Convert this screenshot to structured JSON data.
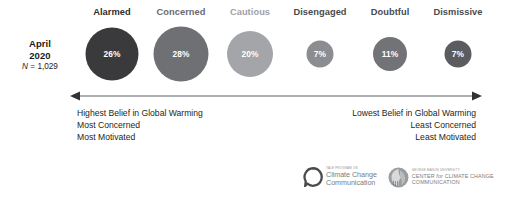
{
  "chart_data": {
    "type": "bar",
    "subtitle": "",
    "xlabel": "",
    "ylabel": "",
    "units": "percent",
    "categories": [
      "Alarmed",
      "Concerned",
      "Cautious",
      "Disengaged",
      "Doubtful",
      "Dismissive"
    ],
    "values": [
      26,
      28,
      20,
      7,
      11,
      7
    ],
    "value_labels": [
      "26%",
      "28%",
      "20%",
      "7%",
      "11%",
      "7%"
    ],
    "series": [
      {
        "name": "April 2020",
        "values": [
          26,
          28,
          20,
          7,
          11,
          7
        ]
      }
    ],
    "colors": [
      "#3a3a3c",
      "#6f7073",
      "#a3a5a8",
      "#8b8d90",
      "#727376",
      "#5b5c5f"
    ],
    "grid": false,
    "legend": "none"
  },
  "survey": {
    "month": "April",
    "year": "2020",
    "sample_label": "N",
    "sample_equals": " = ",
    "sample_size": "1,029",
    "sample_full": "N = 1,029"
  },
  "segments": [
    {
      "label": "Alarmed",
      "value": "26%",
      "value_num": 26,
      "color": "#3a3a3c",
      "label_color": "#2e2e30",
      "diameter": 53,
      "center_x": 112
    },
    {
      "label": "Concerned",
      "value": "28%",
      "value_num": 28,
      "color": "#6f7073",
      "label_color": "#6a6b6e",
      "diameter": 55,
      "center_x": 181
    },
    {
      "label": "Cautious",
      "value": "20%",
      "value_num": 20,
      "color": "#a3a5a8",
      "label_color": "#a0a2a5",
      "diameter": 46,
      "center_x": 250
    },
    {
      "label": "Disengaged",
      "value": "7%",
      "value_num": 7,
      "color": "#8b8d90",
      "label_color": "#4a4b4d",
      "diameter": 27,
      "center_x": 320
    },
    {
      "label": "Doubtful",
      "value": "11%",
      "value_num": 11,
      "color": "#727376",
      "label_color": "#4a4b4d",
      "diameter": 34,
      "center_x": 390
    },
    {
      "label": "Dismissive",
      "value": "7%",
      "value_num": 7,
      "color": "#5b5c5f",
      "label_color": "#4a4b4d",
      "diameter": 27,
      "center_x": 458
    }
  ],
  "continuum": {
    "left_descriptor": {
      "line1": "Highest Belief in Global Warming",
      "line2": "Most Concerned",
      "line3": "Most Motivated"
    },
    "right_descriptor": {
      "line1": "Lowest Belief in Global Warming",
      "line2": "Least Concerned",
      "line3": "Least Motivated"
    },
    "arrow_color": "#5d5f61"
  },
  "logos": {
    "yale": {
      "eyebrow": "YALE PROGRAM ON",
      "line1": "Climate Change",
      "line2": "Communication",
      "mark_name": "yale-climate-communication-logo"
    },
    "gmu": {
      "eyebrow": "GEORGE MASON UNIVERSITY",
      "line1_a": "CENTER ",
      "line1_b": "for",
      "line1_c": " CLIMATE CHANGE",
      "line2": "COMMUNICATION",
      "mark_name": "george-mason-mascot-logo"
    }
  }
}
